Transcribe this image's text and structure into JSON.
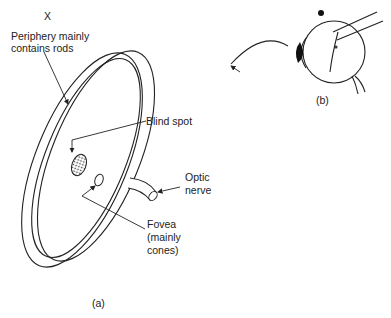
{
  "panel_a": {
    "marker": "X",
    "periphery_label_line1": "Periphery mainly",
    "periphery_label_line2": "contains rods",
    "blind_spot_label": "Blind spot",
    "optic_nerve_line1": "Optic",
    "optic_nerve_line2": "nerve",
    "fovea_line1": "Fovea",
    "fovea_line2": "(mainly",
    "fovea_line3": "cones)",
    "caption": "(a)"
  },
  "panel_b": {
    "caption": "(b)"
  },
  "colors": {
    "line": "#222222",
    "background": "#ffffff"
  }
}
